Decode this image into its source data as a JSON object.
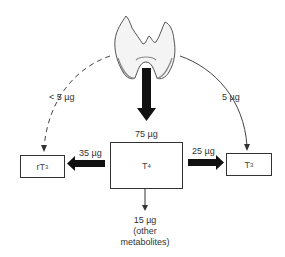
{
  "diagram": {
    "source": {
      "name": "thyroid gland",
      "icon": "thyroid-gland-icon"
    },
    "nodes": {
      "t4": {
        "label": "T",
        "sub": "4",
        "input_amount": "75 µg"
      },
      "rt3": {
        "label": "rT",
        "sub": "3"
      },
      "t3": {
        "label": "T",
        "sub": "3"
      }
    },
    "edges": {
      "thyroid_to_rt3": {
        "amount": "< 5 µg",
        "style": "dashed"
      },
      "thyroid_to_t3": {
        "amount": "5 µg",
        "style": "solid"
      },
      "thyroid_to_t4": {
        "amount": "75 µg",
        "style": "thick"
      },
      "t4_to_rt3": {
        "amount": "35 µg",
        "style": "thick"
      },
      "t4_to_t3": {
        "amount": "25 µg",
        "style": "thick"
      },
      "t4_to_other": {
        "amount": "15 µg",
        "line1": "(other",
        "line2": "metabolites)",
        "style": "thin"
      }
    }
  }
}
